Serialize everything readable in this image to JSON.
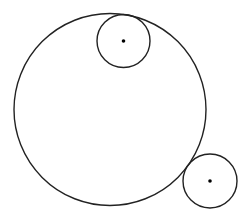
{
  "diagram": {
    "type": "geometry",
    "background": "#ffffff",
    "stroke_color": "#222222",
    "circles": [
      {
        "id": "large-circle",
        "cx": 110,
        "cy": 109.5,
        "r": 96,
        "stroke_width": 1.4,
        "center_dot": false
      },
      {
        "id": "small-circle-top",
        "cx": 123.5,
        "cy": 41,
        "r": 26.5,
        "stroke_width": 1.4,
        "center_dot": true
      },
      {
        "id": "small-circle-bottom-right",
        "cx": 210,
        "cy": 181,
        "r": 27,
        "stroke_width": 1.4,
        "center_dot": true
      }
    ],
    "center_dot_radius": 1.8
  }
}
